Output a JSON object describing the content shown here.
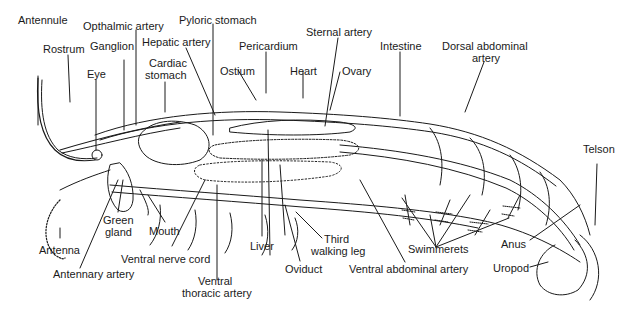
{
  "diagram": {
    "colors": {
      "ink": "#1a1a1a",
      "background": "#ffffff"
    },
    "labels": {
      "antennule": "Antennule",
      "rostrum": "Rostrum",
      "opthalmic_artery": "Opthalmic artery",
      "ganglion": "Ganglion",
      "eye": "Eye",
      "pyloric_stomach": "Pyloric stomach",
      "hepatic_artery": "Hepatic artery",
      "cardiac_stomach_1": "Cardiac",
      "cardiac_stomach_2": "stomach",
      "pericardium": "Pericardium",
      "ostium": "Ostium",
      "heart": "Heart",
      "sternal_artery": "Sternal artery",
      "ovary": "Ovary",
      "intestine": "Intestine",
      "dorsal_abdominal_artery_1": "Dorsal abdominal",
      "dorsal_abdominal_artery_2": "artery",
      "telson": "Telson",
      "antenna": "Antenna",
      "antennary_artery": "Antennary artery",
      "green_gland_1": "Green",
      "green_gland_2": "gland",
      "mouth": "Mouth",
      "ventral_nerve_cord": "Ventral nerve cord",
      "ventral_thoracic_artery_1": "Ventral",
      "ventral_thoracic_artery_2": "thoracic artery",
      "liver": "Liver",
      "oviduct": "Oviduct",
      "third_walking_leg_1": "Third",
      "third_walking_leg_2": "walking leg",
      "ventral_abdominal_artery": "Ventral abdominal artery",
      "swimmerets": "Swimmerets",
      "anus": "Anus",
      "uropod": "Uropod"
    }
  }
}
